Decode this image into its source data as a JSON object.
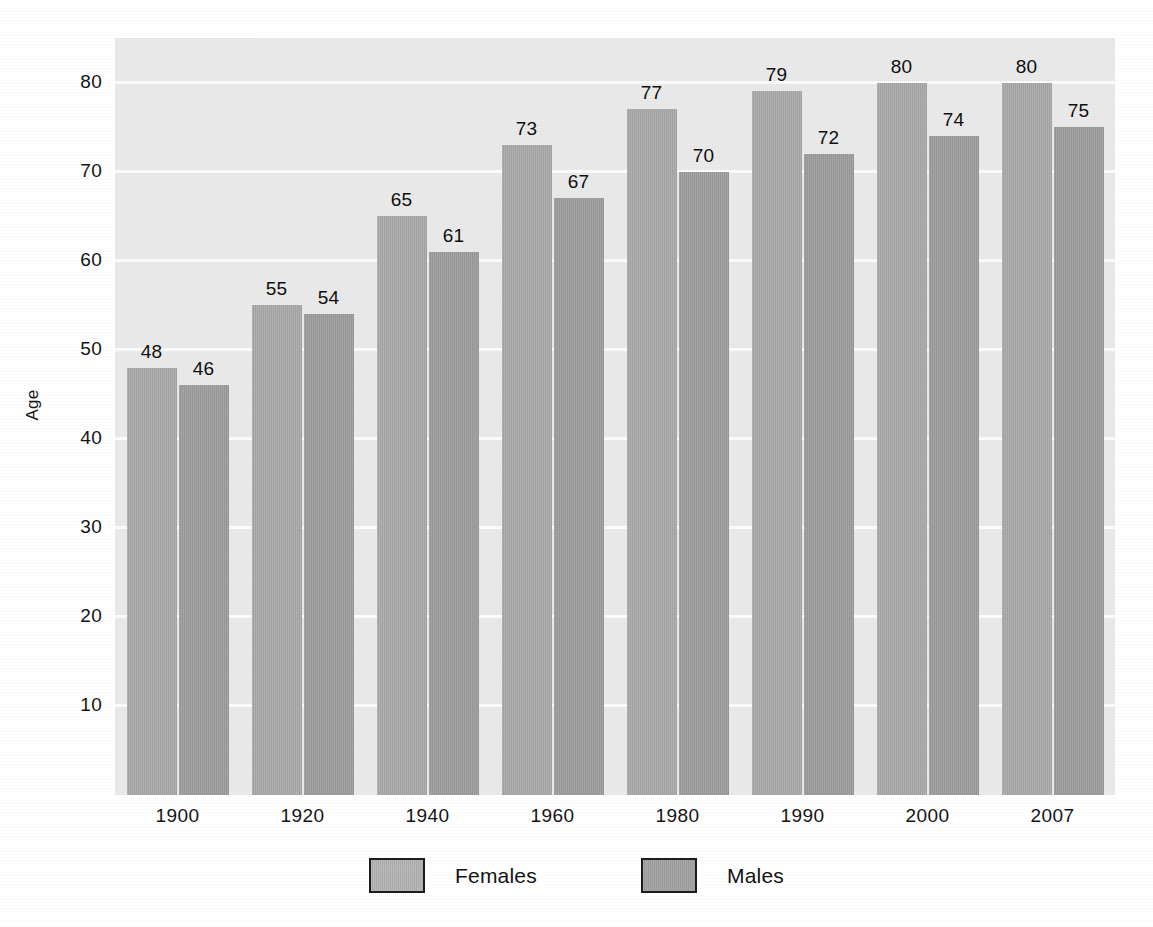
{
  "chart_data": {
    "type": "bar",
    "title": "",
    "subtitle": "",
    "xlabel": "",
    "ylabel": "Age",
    "categories": [
      "1900",
      "1920",
      "1940",
      "1960",
      "1980",
      "1990",
      "2000",
      "2007"
    ],
    "series": [
      {
        "name": "Females",
        "values": [
          48,
          55,
          65,
          73,
          77,
          79,
          80,
          80
        ],
        "color": "#a8a8a8"
      },
      {
        "name": "Males",
        "values": [
          46,
          54,
          61,
          67,
          70,
          72,
          74,
          75
        ],
        "color": "#9d9d9d"
      }
    ],
    "ylim": [
      0,
      85
    ],
    "yticks": [
      10,
      20,
      30,
      40,
      50,
      60,
      70,
      80
    ],
    "ytick_labels": [
      "10",
      "20",
      "30",
      "40",
      "50",
      "60",
      "70",
      "80"
    ],
    "grid": "horizontal-only",
    "grid_color": "#fbfbfb",
    "plot_background": "#e9e9e9",
    "page_background": "#ffffff",
    "legend_position": "bottom-center",
    "data_labels": "above-bars",
    "bar_labels": {
      "Females": [
        "48",
        "55",
        "65",
        "73",
        "77",
        "79",
        "80",
        "80"
      ],
      "Males": [
        "46",
        "54",
        "61",
        "67",
        "70",
        "72",
        "74",
        "75"
      ]
    }
  },
  "legend": {
    "items": [
      {
        "label": "Females",
        "swatch": "females"
      },
      {
        "label": "Males",
        "swatch": "males"
      }
    ]
  },
  "axes": {
    "y_title": "Age"
  }
}
